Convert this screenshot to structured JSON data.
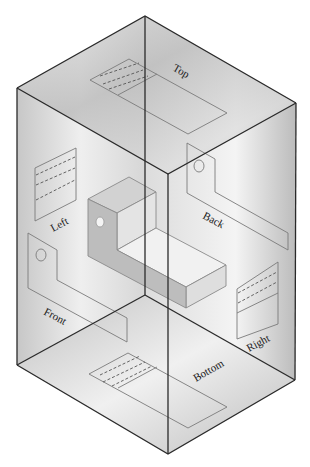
{
  "figure": {
    "labels": {
      "top": "Top",
      "left": "Left",
      "back": "Back",
      "front": "Front",
      "right": "Right",
      "bottom": "Bottom"
    }
  },
  "colors": {
    "edge": "#2a2a2a",
    "view_outline": "#7a7a7a",
    "glass_light": "#f4f4f4",
    "glass_dark": "#a8a8a8"
  }
}
